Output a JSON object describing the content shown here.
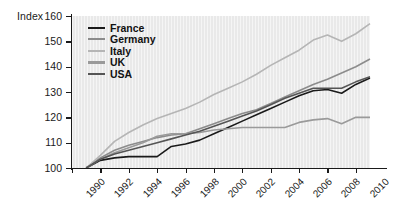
{
  "chart_data": {
    "type": "line",
    "title": "",
    "xlabel": "",
    "ylabel": "Index",
    "xlim": [
      1990,
      2011
    ],
    "ylim": [
      100,
      160
    ],
    "yticks": [
      100,
      110,
      120,
      130,
      140,
      150,
      160
    ],
    "xticks": [
      1990,
      1992,
      1994,
      1996,
      1998,
      2000,
      2002,
      2004,
      2006,
      2008,
      2010
    ],
    "grid": false,
    "legend_position": "top-left",
    "x": [
      1991,
      1992,
      1993,
      1994,
      1995,
      1996,
      1997,
      1998,
      1999,
      2000,
      2001,
      2002,
      2003,
      2004,
      2005,
      2006,
      2007,
      2008,
      2009,
      2010,
      2011
    ],
    "series": [
      {
        "name": "France",
        "color": "#1a1a1a",
        "values": [
          100,
          103,
          104,
          104.5,
          104.5,
          104.5,
          108.5,
          109.5,
          111,
          113.5,
          116,
          118.5,
          121,
          123.5,
          126,
          128.5,
          130.5,
          131,
          129.5,
          133,
          135.5
        ]
      },
      {
        "name": "Germany",
        "color": "#8c8c8c",
        "values": [
          100,
          104,
          107,
          109,
          110.5,
          112,
          113,
          113.5,
          115.5,
          117.5,
          119.5,
          121.5,
          123,
          125.5,
          128,
          130.5,
          133,
          135,
          137.5,
          140,
          143
        ]
      },
      {
        "name": "Italy",
        "color": "#b5b5b5",
        "values": [
          100,
          105,
          110.5,
          114,
          117,
          119.5,
          121.5,
          123.5,
          126,
          129,
          131.5,
          134,
          137,
          140.5,
          143.5,
          146.5,
          150.5,
          152.5,
          150,
          153,
          157
        ]
      },
      {
        "name": "UK",
        "color": "#9a9a9a",
        "values": [
          100,
          103.5,
          106,
          108,
          110,
          112.5,
          113.5,
          113.5,
          114,
          115,
          115.5,
          116,
          116,
          116,
          116,
          118,
          119,
          119.5,
          117.5,
          120,
          120
        ]
      },
      {
        "name": "USA",
        "color": "#555555",
        "values": [
          100,
          103.5,
          105.5,
          107,
          108.5,
          110,
          111.5,
          113,
          114.5,
          116.5,
          118.5,
          120.5,
          122.5,
          125,
          127.5,
          129.5,
          131.5,
          131.5,
          131.5,
          134,
          136
        ]
      }
    ],
    "legend_entries": [
      {
        "label": "France",
        "color": "#1a1a1a"
      },
      {
        "label": "Germany",
        "color": "#8c8c8c"
      },
      {
        "label": "Italy",
        "color": "#b5b5b5"
      },
      {
        "label": "UK",
        "color": "#9a9a9a"
      },
      {
        "label": "USA",
        "color": "#555555"
      }
    ]
  }
}
